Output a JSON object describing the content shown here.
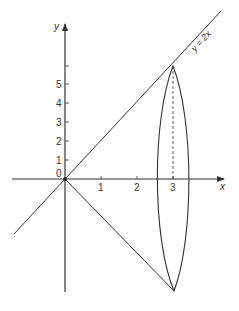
{
  "figure": {
    "type": "diagram",
    "axes": {
      "x_label": "x",
      "y_label": "y",
      "origin_label": "0",
      "x_ticks": [
        "1",
        "2",
        "3"
      ],
      "y_ticks": [
        "1",
        "2",
        "3",
        "4",
        "5"
      ]
    },
    "curve_label": "y = 2x",
    "colors": {
      "line": "#333333",
      "background": "#ffffff"
    }
  }
}
